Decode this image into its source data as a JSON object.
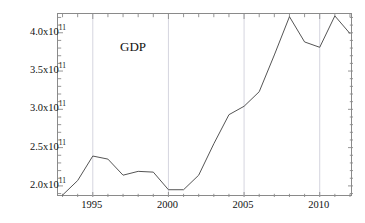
{
  "chart_data": {
    "type": "line",
    "title": "",
    "xlabel": "time",
    "ylabel": "GDP",
    "xlim": [
      1992.7,
      2012.2
    ],
    "ylim": [
      185500000000.0,
      424500000000.0
    ],
    "grid": true,
    "grid_axis": "x",
    "legend": "none",
    "line_color": "#555555",
    "frame_color": "#8a8a8a",
    "grid_color": "#c9c9d6",
    "x": [
      1993,
      1994,
      1995,
      1996,
      1997,
      1998,
      1999,
      2000,
      2001,
      2002,
      2003,
      2004,
      2005,
      2006,
      2007,
      2008,
      2009,
      2010,
      2011,
      2012
    ],
    "values": [
      188000000000.0,
      207000000000.0,
      239000000000.0,
      235000000000.0,
      214000000000.0,
      219000000000.0,
      218000000000.0,
      195000000000.0,
      195000000000.0,
      214000000000.0,
      255000000000.0,
      293000000000.0,
      304000000000.0,
      323000000000.0,
      371000000000.0,
      421000000000.0,
      388000000000.0,
      381000000000.0,
      422000000000.0,
      399000000000.0
    ],
    "series": [
      {
        "name": "GDP",
        "values": [
          188000000000.0,
          207000000000.0,
          239000000000.0,
          235000000000.0,
          214000000000.0,
          219000000000.0,
          218000000000.0,
          195000000000.0,
          195000000000.0,
          214000000000.0,
          255000000000.0,
          293000000000.0,
          304000000000.0,
          323000000000.0,
          371000000000.0,
          421000000000.0,
          388000000000.0,
          381000000000.0,
          422000000000.0,
          399000000000.0
        ]
      }
    ],
    "yticks": [
      200000000000.0,
      250000000000.0,
      300000000000.0,
      350000000000.0,
      400000000000.0
    ],
    "ytick_labels": [
      "2.0x10",
      "2.5x10",
      "3.0x10",
      "3.5x10",
      "4.0x10"
    ],
    "ytick_exponent": "11",
    "xticks": [
      1995,
      2000,
      2005,
      2010
    ],
    "xtick_labels": [
      "1995",
      "2000",
      "2005",
      "2010"
    ],
    "x_minor_interval": 1,
    "gridlines_x": [
      1995,
      2000,
      2005,
      2010
    ]
  },
  "axis_labels": {
    "y_axis_name": "GDP",
    "x_axis_name": "time"
  }
}
